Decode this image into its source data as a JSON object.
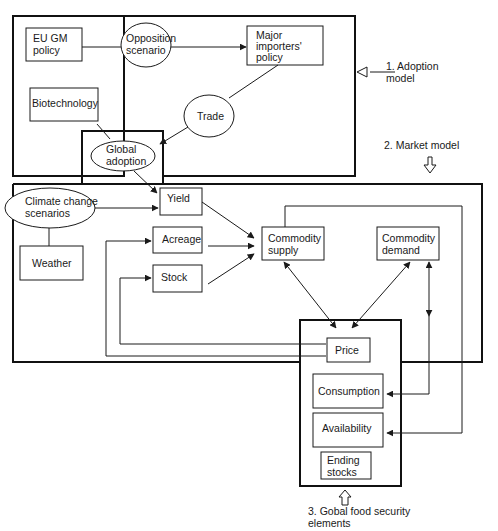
{
  "sections": {
    "adoption_model": {
      "label_line1": "1. Adoption",
      "label_line2": "model"
    },
    "market_model": {
      "label": "2. Market model"
    },
    "food_security": {
      "label_line1": "3. Gobal food security",
      "label_line2": "elements"
    }
  },
  "nodes": {
    "eu_gm_policy": {
      "line1": "EU GM",
      "line2": "policy"
    },
    "opposition_scenario": {
      "line1": "Opposition",
      "line2": "scenario"
    },
    "major_importers_policy": {
      "line1": "Major",
      "line2": "importers'",
      "line3": "policy"
    },
    "biotechnology": {
      "label": "Biotechnology"
    },
    "trade": {
      "label": "Trade"
    },
    "global_adoption": {
      "line1": "Global",
      "line2": "adoption"
    },
    "climate_change_scenarios": {
      "line1": "Climate change",
      "line2": "scenarios"
    },
    "weather": {
      "label": "Weather"
    },
    "yield": {
      "label": "Yield"
    },
    "acreage": {
      "label": "Acreage"
    },
    "stock": {
      "label": "Stock"
    },
    "commodity_supply": {
      "line1": "Commodity",
      "line2": "supply"
    },
    "commodity_demand": {
      "line1": "Commodity",
      "line2": "demand"
    },
    "price": {
      "label": "Price"
    },
    "consumption": {
      "label": "Consumption"
    },
    "availability": {
      "label": "Availability"
    },
    "ending_stocks": {
      "line1": "Ending",
      "line2": "stocks"
    }
  },
  "colors": {
    "line": "#1a1a1a",
    "background": "#ffffff"
  }
}
